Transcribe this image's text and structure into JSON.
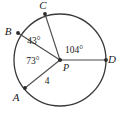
{
  "figure": {
    "background_color": "#ffffff",
    "stroke_color": "#3a3a3a",
    "text_color": "#1b1b1b",
    "circle": {
      "center_label": "P",
      "center_x": 60,
      "center_y": 60,
      "radius_px": 46
    },
    "points": [
      {
        "name": "C",
        "label": "C",
        "x": 45,
        "y": 14,
        "label_x": 43,
        "label_y": 9
      },
      {
        "name": "B",
        "label": "B",
        "x": 18,
        "y": 33,
        "label_x": 8,
        "label_y": 35
      },
      {
        "name": "A",
        "label": "A",
        "x": 25,
        "y": 88,
        "label_x": 16,
        "label_y": 101
      },
      {
        "name": "D",
        "label": "D",
        "x": 106,
        "y": 60,
        "label_x": 112,
        "label_y": 62
      }
    ],
    "center_point": {
      "label": "P",
      "x": 60,
      "y": 60,
      "label_x": 63,
      "label_y": 71
    },
    "angles": [
      {
        "name": "angle-BPC",
        "label": "43°",
        "x": 34,
        "y": 44
      },
      {
        "name": "angle-CPD",
        "label": "104°",
        "x": 65,
        "y": 53
      },
      {
        "name": "angle-APB",
        "label": "73°",
        "x": 33,
        "y": 64
      }
    ],
    "lengths": [
      {
        "name": "radius-PA",
        "label": "4",
        "x": 47,
        "y": 83
      }
    ],
    "radii": [
      {
        "name": "radius-PC",
        "from": "P",
        "to": "C"
      },
      {
        "name": "radius-PB",
        "from": "P",
        "to": "B"
      },
      {
        "name": "radius-PA",
        "from": "P",
        "to": "A"
      },
      {
        "name": "radius-PD",
        "from": "P",
        "to": "D"
      }
    ]
  }
}
